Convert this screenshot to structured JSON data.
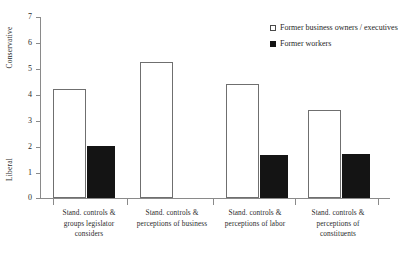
{
  "chart_data": {
    "type": "bar",
    "title": "",
    "xlabel": "",
    "ylabel": "",
    "ylim": [
      0,
      7
    ],
    "grid": false,
    "legend_position": "top-right",
    "y_axis_top_anchor": "Conservative",
    "y_axis_bottom_anchor": "Liberal",
    "y_ticks": [
      7,
      6,
      5,
      4,
      3,
      2,
      1,
      0
    ],
    "categories": [
      "Stand. controls & groups legislator considers",
      "Stand. controls & perceptions of business",
      "Stand. controls & perceptions of labor",
      "Stand. controls & perceptions of constituents"
    ],
    "category_lines": [
      [
        "Stand. controls &",
        "groups legislator",
        "considers"
      ],
      [
        "Stand. controls &",
        "perceptions of business"
      ],
      [
        "Stand. controls &",
        "perceptions of labor"
      ],
      [
        "Stand. controls &",
        "perceptions of",
        "constituents"
      ]
    ],
    "series": [
      {
        "name": "Former business owners / executives",
        "color": "#ffffff",
        "edge_color": "#6f6f6f",
        "values": [
          4.2,
          5.25,
          4.4,
          3.4
        ]
      },
      {
        "name": "Former workers",
        "color": "#141414",
        "edge_color": "#141414",
        "values": [
          2.0,
          null,
          1.65,
          1.7
        ]
      }
    ]
  },
  "legend": {
    "items": [
      {
        "label": "Former business owners / executives",
        "marker": "open-square"
      },
      {
        "label": "Former workers",
        "marker": "filled-square"
      }
    ]
  },
  "axis": {
    "tick_labels": [
      "7",
      "6",
      "5",
      "4",
      "3",
      "2",
      "1",
      "0"
    ],
    "conservative_label": "Conservative",
    "liberal_label": "Liberal"
  }
}
